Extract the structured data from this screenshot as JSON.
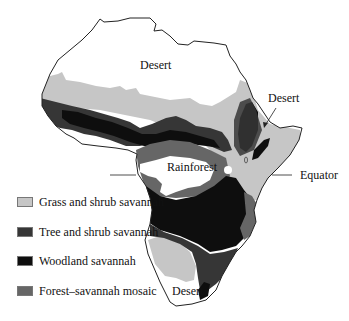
{
  "map": {
    "region": "Africa",
    "labels": {
      "desert_north": "Desert",
      "desert_horn": "Desert",
      "rainforest": "Rainforest",
      "equator": "Equator",
      "desert_south": "Desert"
    },
    "colors": {
      "desert": "#ffffff",
      "rainforest": "#ffffff",
      "outline": "#222222"
    }
  },
  "legend": {
    "items": [
      {
        "label": "Grass and shrub savannah",
        "color": "#c6c6c6"
      },
      {
        "label": "Tree and shrub savannah",
        "color": "#363636"
      },
      {
        "label": "Woodland savannah",
        "color": "#0e0e0e"
      },
      {
        "label": "Forest–savannah mosaic",
        "color": "#666666"
      }
    ]
  }
}
